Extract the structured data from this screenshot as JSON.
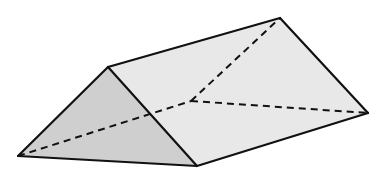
{
  "figure": {
    "colors": {
      "front_face": "#cfcfcf",
      "slanted_face": "#e8e8e8",
      "edge": "#111111",
      "background": "#ffffff"
    },
    "faces": [
      "front-triangle",
      "top-slanted-face"
    ],
    "visible_edges": 7,
    "hidden_edges": 3
  }
}
